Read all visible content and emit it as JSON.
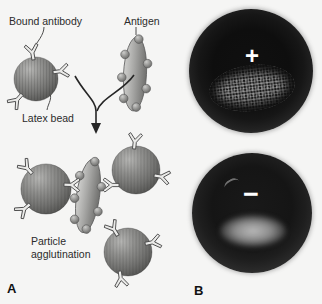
{
  "figure": {
    "panel_a": {
      "label": "A",
      "callouts": {
        "bound_antibody": "Bound antibody",
        "antigen": "Antigen",
        "latex_bead": "Latex bead",
        "particle_agglutination": "Particle agglutination"
      }
    },
    "panel_b": {
      "label": "B",
      "positive_sign": "+",
      "negative_sign": "−"
    },
    "icons": {
      "antibody": "y-shape-antibody-icon",
      "latex_bead": "shaded-gray-sphere",
      "antigen": "oval-with-epitope-spheres",
      "reaction_arrow": "merging-down-arrow"
    },
    "colors": {
      "background": "#f5f5f4",
      "bead_gray": "#7a7a78",
      "antibody_fill": "#eaeae8",
      "outline_gray": "#4a4a4a",
      "photo_well_dark": "#111111",
      "photo_rim_gray": "#5d5d5d",
      "result_sign_white": "#ffffff",
      "label_text": "#2b2b2b"
    }
  }
}
